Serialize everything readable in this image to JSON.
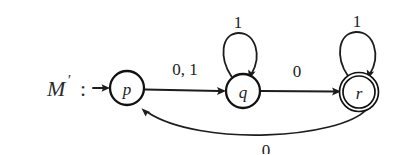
{
  "diagram": {
    "kind": "finite-state-automaton",
    "machine_label": "M'",
    "machine_label_base": "M",
    "machine_label_prime": "′",
    "machine_label_colon": ":",
    "background_color": "#ffffff",
    "ink_color": "#1d1d1d",
    "states": [
      {
        "id": "p",
        "label": "p",
        "x": 127,
        "y": 88,
        "radius": 17,
        "accepting": false,
        "start": true
      },
      {
        "id": "q",
        "label": "q",
        "x": 243,
        "y": 91,
        "radius": 17,
        "accepting": false,
        "start": false
      },
      {
        "id": "r",
        "label": "r",
        "x": 359,
        "y": 92,
        "radius": 16,
        "outer_radius": 19.5,
        "accepting": true,
        "start": false
      }
    ],
    "transitions": [
      {
        "from": "start",
        "to": "p",
        "label": "",
        "shape": "straight",
        "label_x": 0,
        "label_y": 0
      },
      {
        "from": "p",
        "to": "q",
        "label": "0, 1",
        "shape": "straight",
        "label_x": 185,
        "label_y": 69
      },
      {
        "from": "q",
        "to": "q",
        "label": "1",
        "shape": "self-loop",
        "label_x": 238,
        "label_y": 22
      },
      {
        "from": "q",
        "to": "r",
        "label": "0",
        "shape": "straight",
        "label_x": 297,
        "label_y": 71
      },
      {
        "from": "r",
        "to": "r",
        "label": "1",
        "shape": "self-loop",
        "label_x": 357,
        "label_y": 21
      },
      {
        "from": "r",
        "to": "p",
        "label": "0",
        "shape": "arc-below",
        "label_x": 266,
        "label_y": 150
      }
    ],
    "alphabet": [
      "0",
      "1"
    ],
    "start_state": "p",
    "accepting_states": [
      "r"
    ]
  }
}
